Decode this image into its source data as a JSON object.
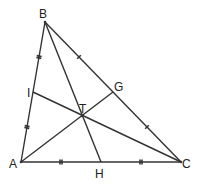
{
  "diagram": {
    "type": "triangle-medians",
    "line_color": "#333333",
    "points": {
      "A": {
        "label": "A",
        "x": 21,
        "y": 162
      },
      "B": {
        "label": "B",
        "x": 45,
        "y": 22
      },
      "C": {
        "label": "C",
        "x": 181,
        "y": 162
      },
      "H": {
        "label": "H",
        "x": 101,
        "y": 162
      },
      "G": {
        "label": "G",
        "x": 113,
        "y": 92
      },
      "I": {
        "label": "I",
        "x": 33,
        "y": 92
      },
      "T": {
        "label": "T",
        "x": 82,
        "y": 116
      }
    },
    "segments": [
      "AB",
      "BC",
      "CA",
      "BH",
      "AG",
      "CI"
    ],
    "tick_marks": {
      "AI_IB": "double",
      "BG_GC": "single",
      "AH_HC": "double"
    }
  }
}
